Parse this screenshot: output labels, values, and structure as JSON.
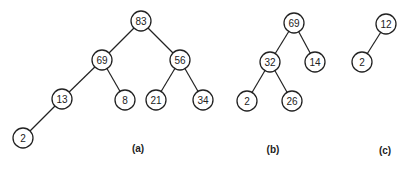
{
  "trees": [
    {
      "caption": "(a)",
      "caption_pos": [
        138,
        152
      ],
      "nodes": [
        {
          "id": "a83",
          "label": "83",
          "x": 141,
          "y": 21
        },
        {
          "id": "a69",
          "label": "69",
          "x": 102,
          "y": 60
        },
        {
          "id": "a56",
          "label": "56",
          "x": 180,
          "y": 60
        },
        {
          "id": "a13",
          "label": "13",
          "x": 62,
          "y": 99
        },
        {
          "id": "a8",
          "label": "8",
          "x": 125,
          "y": 100
        },
        {
          "id": "a21",
          "label": "21",
          "x": 156,
          "y": 100
        },
        {
          "id": "a34",
          "label": "34",
          "x": 203,
          "y": 100
        },
        {
          "id": "a2",
          "label": "2",
          "x": 23,
          "y": 138
        }
      ],
      "edges": [
        [
          "a83",
          "a69"
        ],
        [
          "a83",
          "a56"
        ],
        [
          "a69",
          "a13"
        ],
        [
          "a69",
          "a8"
        ],
        [
          "a56",
          "a21"
        ],
        [
          "a56",
          "a34"
        ],
        [
          "a13",
          "a2"
        ]
      ]
    },
    {
      "caption": "(b)",
      "caption_pos": [
        273,
        153
      ],
      "nodes": [
        {
          "id": "b69",
          "label": "69",
          "x": 294,
          "y": 23
        },
        {
          "id": "b32",
          "label": "32",
          "x": 270,
          "y": 62
        },
        {
          "id": "b14",
          "label": "14",
          "x": 315,
          "y": 62
        },
        {
          "id": "b2",
          "label": "2",
          "x": 247,
          "y": 101
        },
        {
          "id": "b26",
          "label": "26",
          "x": 292,
          "y": 101
        }
      ],
      "edges": [
        [
          "b69",
          "b32"
        ],
        [
          "b69",
          "b14"
        ],
        [
          "b32",
          "b2"
        ],
        [
          "b32",
          "b26"
        ]
      ]
    },
    {
      "caption": "(c)",
      "caption_pos": [
        385,
        154
      ],
      "nodes": [
        {
          "id": "c12",
          "label": "12",
          "x": 386,
          "y": 24
        },
        {
          "id": "c2",
          "label": "2",
          "x": 362,
          "y": 62
        }
      ],
      "edges": [
        [
          "c12",
          "c2"
        ]
      ]
    }
  ],
  "node_radius": 10
}
